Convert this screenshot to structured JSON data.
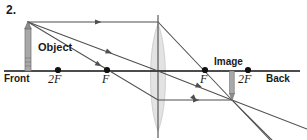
{
  "figure": {
    "problem_number": "2.",
    "type": "converging-lens-ray-diagram",
    "labels": {
      "object": "Object",
      "image": "Image",
      "front": "Front",
      "back": "Back",
      "two_f_left": "2F",
      "f_left": "F",
      "f_right": "F",
      "two_f_right": "2F"
    },
    "colors": {
      "axis": "#1a1a1a",
      "ray": "#4a4a4a",
      "lens_fill": "#e0e0e0",
      "lens_outline": "#bdbdbd",
      "object_fill": "#9a9a9a",
      "text": "#1a1a1a",
      "background": "#ffffff"
    },
    "geometry": {
      "optical_axis_y": 71,
      "axis_x_start": 4,
      "axis_x_end": 300,
      "lens_center_x": 158,
      "lens_top_y": 24,
      "lens_bottom_y": 131,
      "lens_half_width": 10,
      "principal_axis_vertical_top": 15,
      "principal_axis_vertical_bottom": 138,
      "object_x": 28,
      "object_tip_y": 22,
      "object_base_y": 71,
      "image_x": 232,
      "image_tip_y": 100,
      "image_base_y": 71,
      "focal_points": [
        {
          "name": "2F",
          "x": 58,
          "side": "front"
        },
        {
          "name": "F",
          "x": 107,
          "side": "front"
        },
        {
          "name": "F",
          "x": 205,
          "side": "back"
        },
        {
          "name": "2F",
          "x": 248,
          "side": "back"
        }
      ],
      "rays": [
        {
          "name": "parallel-ray",
          "description": "parallel to axis then refracted through far focal point to image tip",
          "points": [
            [
              28,
              22
            ],
            [
              158,
              22
            ],
            [
              232,
              100
            ],
            [
              295,
              166
            ]
          ],
          "arrowheads": [
            {
              "x": 95,
              "y": 22,
              "angle": 0
            },
            {
              "x": 196,
              "y": 99,
              "angle": 46
            }
          ]
        },
        {
          "name": "center-ray",
          "description": "through optical center undeviated to image tip",
          "points": [
            [
              28,
              22
            ],
            [
              158,
              71
            ],
            [
              232,
              100
            ],
            [
              307,
              129
            ]
          ],
          "arrowheads": [
            {
              "x": 110,
              "y": 53,
              "angle": 21
            },
            {
              "x": 196,
              "y": 86,
              "angle": 21
            }
          ]
        },
        {
          "name": "focal-ray",
          "description": "through near focal point then parallel to axis to image tip",
          "points": [
            [
              28,
              22
            ],
            [
              158,
              100
            ],
            [
              232,
              100
            ]
          ],
          "arrowheads": [
            {
              "x": 100,
              "y": 70,
              "angle": 33
            },
            {
              "x": 196,
              "y": 100,
              "angle": 0
            }
          ]
        },
        {
          "name": "focal-ray-extension",
          "description": "continuation beyond image point",
          "points": [
            [
              232,
              100
            ],
            [
              272,
              140
            ]
          ]
        }
      ]
    }
  }
}
